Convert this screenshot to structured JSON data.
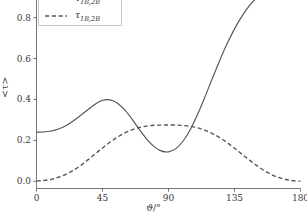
{
  "chart_data": {
    "type": "line",
    "title": "",
    "xlabel": "ϑ/°",
    "ylabel": "<τ>",
    "xlim": [
      0,
      180
    ],
    "ylim": [
      -0.035,
      0.93
    ],
    "xticks": [
      "0",
      "45",
      "90",
      "135",
      "180"
    ],
    "xtick_values": [
      0,
      45,
      90,
      135,
      180
    ],
    "yticks": [
      "0.0",
      "0.2",
      "0.4",
      "0.6",
      "0.8"
    ],
    "ytick_values": [
      0.0,
      0.2,
      0.4,
      0.6,
      0.8
    ],
    "grid": false,
    "legend_position": "upper left",
    "line_color": "#555555",
    "axis_color": "#555555",
    "text_color": "#3a3a3a",
    "background": "#ffffff",
    "series": [
      {
        "name": "tau_1B_2Bbar",
        "legend_label": "τ",
        "legend_sub": "1B,2B̅",
        "style": "solid",
        "color": "#555555",
        "x": [
          0,
          5,
          10,
          15,
          20,
          25,
          30,
          35,
          40,
          45,
          50,
          55,
          60,
          65,
          70,
          75,
          80,
          85,
          90,
          95,
          100,
          105,
          110,
          115,
          120,
          125,
          130,
          135,
          140,
          145,
          150,
          155,
          160,
          165,
          170,
          175,
          180
        ],
        "y": [
          0.24,
          0.241,
          0.246,
          0.256,
          0.272,
          0.295,
          0.322,
          0.35,
          0.377,
          0.396,
          0.398,
          0.383,
          0.35,
          0.305,
          0.255,
          0.208,
          0.171,
          0.149,
          0.144,
          0.16,
          0.197,
          0.255,
          0.33,
          0.415,
          0.505,
          0.592,
          0.673,
          0.745,
          0.806,
          0.857,
          0.897,
          0.928,
          0.952,
          0.97,
          0.983,
          0.992,
          0.996
        ]
      },
      {
        "name": "tau_1B_2B",
        "legend_label": "τ",
        "legend_sub": "1B,2B",
        "style": "dashed",
        "color": "#555555",
        "x": [
          0,
          5,
          10,
          15,
          20,
          25,
          30,
          35,
          40,
          45,
          50,
          55,
          60,
          65,
          70,
          75,
          80,
          85,
          90,
          95,
          100,
          105,
          110,
          115,
          120,
          125,
          130,
          135,
          140,
          145,
          150,
          155,
          160,
          165,
          170,
          175,
          180
        ],
        "y": [
          0.002,
          0.004,
          0.01,
          0.02,
          0.034,
          0.053,
          0.077,
          0.105,
          0.134,
          0.163,
          0.191,
          0.215,
          0.236,
          0.252,
          0.263,
          0.27,
          0.274,
          0.275,
          0.275,
          0.275,
          0.273,
          0.269,
          0.261,
          0.249,
          0.233,
          0.213,
          0.189,
          0.162,
          0.133,
          0.105,
          0.078,
          0.054,
          0.034,
          0.019,
          0.009,
          0.003,
          0.001
        ]
      }
    ]
  },
  "axes": {
    "x_label_main": "ϑ",
    "x_label_unit": "/°",
    "y_label_text": "<τ>"
  }
}
